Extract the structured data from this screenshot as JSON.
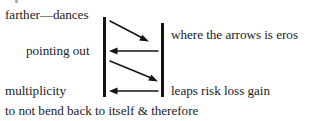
{
  "page": {
    "width": 309,
    "height": 121,
    "background_color": "#ffffff",
    "ink_color": "#1c1c1c"
  },
  "labels": {
    "top_left": "farther—dances",
    "middle_left": "pointing out",
    "bottom_left": "multiplicity",
    "bottom_full": "to not bend back to itself & therefore",
    "top_right": "where the arrows is eros",
    "bottom_right": "leaps risk loss gain"
  },
  "bars": [
    {
      "name": "left-vertical-bar",
      "x": 104.5,
      "y1": 17,
      "y2": 97,
      "width": 3
    },
    {
      "name": "right-vertical-bar",
      "x": 162.5,
      "y1": 23,
      "y2": 97,
      "width": 3
    }
  ],
  "arrows": [
    {
      "name": "arrow-1-diagonal-down-right",
      "direction": "right-down",
      "x1": 110,
      "y1": 21,
      "x2": 148,
      "y2": 41
    },
    {
      "name": "arrow-2-horizontal-left",
      "direction": "left",
      "x1": 158,
      "y1": 51,
      "x2": 110,
      "y2": 51
    },
    {
      "name": "arrow-3-diagonal-down-right",
      "direction": "right-down",
      "x1": 110,
      "y1": 61,
      "x2": 157,
      "y2": 81
    },
    {
      "name": "arrow-4-horizontal-left",
      "direction": "left",
      "x1": 158,
      "y1": 91,
      "x2": 110,
      "y2": 91
    }
  ]
}
